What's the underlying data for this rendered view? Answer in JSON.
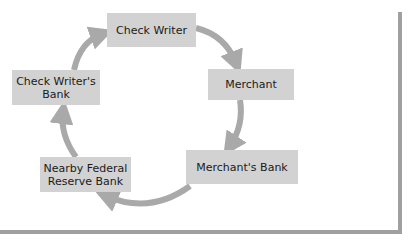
{
  "diagram": {
    "type": "cycle",
    "nodes": [
      {
        "id": "check_writer",
        "label": "Check Writer"
      },
      {
        "id": "merchant",
        "label": "Merchant"
      },
      {
        "id": "merchants_bank",
        "label": "Merchant's Bank"
      },
      {
        "id": "fed_reserve",
        "label": "Nearby Federal Reserve Bank",
        "lines": [
          "Nearby Federal",
          "Reserve Bank"
        ]
      },
      {
        "id": "check_writers_bank",
        "label": "Check Writer's Bank",
        "lines": [
          "Check Writer's",
          "Bank"
        ]
      }
    ],
    "edges": [
      {
        "from": "check_writer",
        "to": "merchant"
      },
      {
        "from": "merchant",
        "to": "merchants_bank"
      },
      {
        "from": "merchants_bank",
        "to": "fed_reserve"
      },
      {
        "from": "fed_reserve",
        "to": "check_writers_bank"
      },
      {
        "from": "check_writers_bank",
        "to": "check_writer"
      }
    ],
    "colors": {
      "box": "#d2d2d2",
      "arrow": "#a9a9a9",
      "frame": "#a0a0a0"
    }
  }
}
